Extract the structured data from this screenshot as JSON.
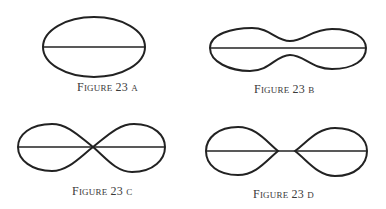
{
  "figures": [
    {
      "id": "a",
      "word": "Figure",
      "number": "23",
      "letter": "a",
      "shape": "ellipse"
    },
    {
      "id": "b",
      "word": "Figure",
      "number": "23",
      "letter": "b",
      "shape": "peanut"
    },
    {
      "id": "c",
      "word": "Figure",
      "number": "23",
      "letter": "c",
      "shape": "figure-eight"
    },
    {
      "id": "d",
      "word": "Figure",
      "number": "23",
      "letter": "d",
      "shape": "separated-lobes"
    }
  ],
  "colors": {
    "stroke": "#222222",
    "text": "#3a3a3a",
    "background": "#ffffff"
  }
}
